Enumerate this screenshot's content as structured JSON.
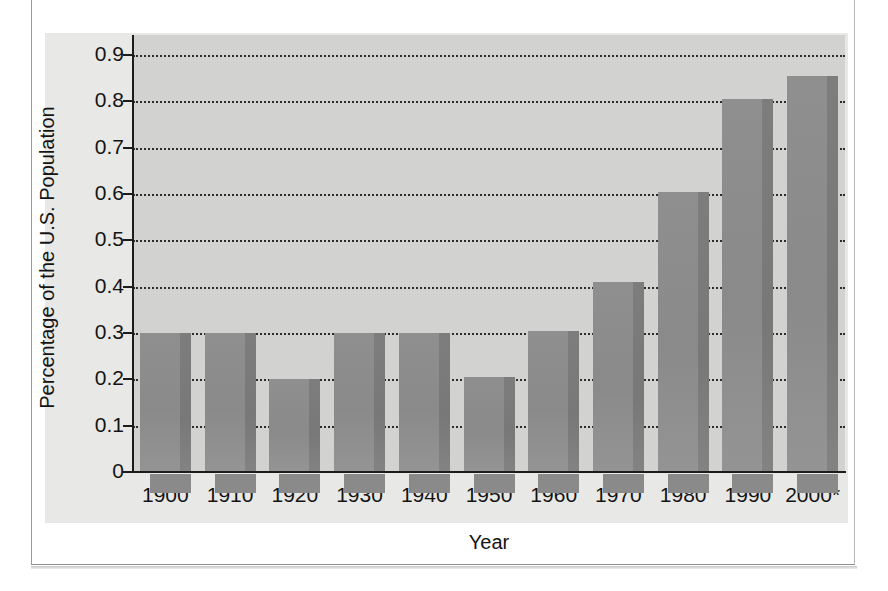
{
  "chart_data": {
    "type": "bar",
    "title": "",
    "xlabel": "Year",
    "ylabel": "Percentage of the U.S. Population",
    "categories": [
      "1900",
      "1910",
      "1920",
      "1930",
      "1940",
      "1950",
      "1960",
      "1970",
      "1980",
      "1990",
      "2000*"
    ],
    "values": [
      0.3,
      0.3,
      0.2,
      0.3,
      0.3,
      0.205,
      0.305,
      0.41,
      0.605,
      0.805,
      0.855
    ],
    "ylim": [
      0,
      0.9
    ],
    "ytick_labels": [
      "0.9",
      "0.8",
      "0.7",
      "0.6",
      "0.5",
      "0.4",
      "0.3",
      "0.2",
      "0.1",
      "0"
    ],
    "ytick_values": [
      0.9,
      0.8,
      0.7,
      0.6,
      0.5,
      0.4,
      0.3,
      0.2,
      0.1,
      0
    ],
    "grid": true,
    "grid_style": "dotted-horizontal",
    "legend": null,
    "annotations": [
      "2000* denotes a projected or asterisked value"
    ],
    "colors": {
      "bar_face": "#8d8d8d",
      "bar_side": "#7a7a7a",
      "plot_background": "#d2d2d0",
      "label_band": "#e8e8e6",
      "axis": "#1c1c1c",
      "grid": "#2b2b2b",
      "page_background": "#ffffff",
      "text": "#141414"
    }
  }
}
